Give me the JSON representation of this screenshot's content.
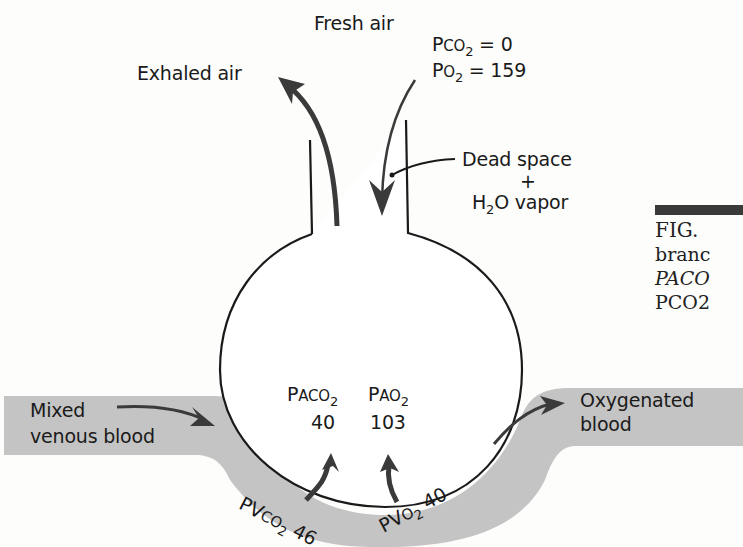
{
  "figure": {
    "top_label": "Fresh air",
    "fresh_air_values": {
      "pco2": {
        "p": "P",
        "sc": "CO",
        "sub": "2",
        "rest": " = 0"
      },
      "po2": {
        "p": "P",
        "sc": "O",
        "sub": "2",
        "rest": " = 159"
      }
    },
    "exhaled_label": "Exhaled air",
    "dead_space": {
      "line1": "Dead space",
      "plus": "+",
      "line2_pre": "H",
      "line2_sub": "2",
      "line2_post": "O vapor"
    },
    "alveolar": {
      "paco2_label": {
        "p": "P",
        "sc": "ACO",
        "sub": "2"
      },
      "pao2_label": {
        "p": "P",
        "sc": "AO",
        "sub": "2"
      },
      "paco2_value": "40",
      "pao2_value": "103"
    },
    "venous": {
      "line1": "Mixed",
      "line2": "venous blood"
    },
    "oxygenated": {
      "line1": "Oxygenated",
      "line2": "blood"
    },
    "capillary": {
      "pvco2": {
        "p": "PV",
        "sc": "CO",
        "sub": "2",
        "value": "46"
      },
      "pvo2": {
        "p": "PV",
        "sc": "O",
        "sub": "2",
        "value": "40"
      }
    },
    "caption_fragment": {
      "line1": "FIG.",
      "line2": "branc",
      "line3": "PACO",
      "line4": "PCO2"
    },
    "colors": {
      "blood": "#c4c4c4",
      "line": "#1a1a1a",
      "arrow": "#3a3a3a"
    }
  }
}
